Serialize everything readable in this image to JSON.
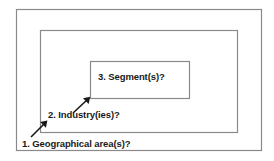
{
  "diagram": {
    "type": "nested-rectangles",
    "stroke_color": "#8a8a8a",
    "text_color": "#1a1a1a",
    "background_color": "#ffffff",
    "levels": [
      {
        "index": 1,
        "label": "1. Geographical area(s)?",
        "icon": "arrow-up-right-icon",
        "rect": {
          "x": 16,
          "y": 9,
          "width": 246,
          "height": 142
        }
      },
      {
        "index": 2,
        "label": "2. Industry(ies)?",
        "icon": "arrow-up-right-icon",
        "rect": {
          "x": 40,
          "y": 30,
          "width": 198,
          "height": 103
        }
      },
      {
        "index": 3,
        "label": "3. Segment(s)?",
        "icon": "arrow-up-right-icon",
        "rect": {
          "x": 90,
          "y": 61,
          "width": 100,
          "height": 38
        }
      }
    ],
    "arrows": [
      {
        "name": "arrow-to-geographical-area",
        "x1": 31,
        "y1": 137,
        "x2": 47,
        "y2": 121
      },
      {
        "name": "arrow-to-industry",
        "x1": 73,
        "y1": 113,
        "x2": 90,
        "y2": 97
      }
    ]
  }
}
